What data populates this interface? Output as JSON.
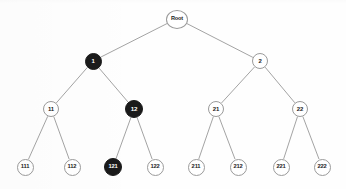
{
  "diagram": {
    "type": "binary-tree",
    "title": "",
    "canvas": {
      "width": 346,
      "height": 189
    },
    "style": {
      "background_color": "#fefefe",
      "edge_color": "#8c8c8c",
      "edge_width": 0.8,
      "light_node_fill": "#ffffff",
      "light_node_border": "#9a9a9a",
      "light_node_text": "#1c1c1c",
      "dark_node_fill": "#1a1a1a",
      "dark_node_text": "#ffffff"
    },
    "levels": [
      {
        "index": 0,
        "y": 19,
        "node_ids": [
          "root"
        ]
      },
      {
        "index": 1,
        "y": 61,
        "node_ids": [
          "n1",
          "n2"
        ]
      },
      {
        "index": 2,
        "y": 109,
        "node_ids": [
          "n11",
          "n12",
          "n21",
          "n22"
        ]
      },
      {
        "index": 3,
        "y": 167,
        "node_ids": [
          "n111",
          "n112",
          "n121",
          "n122",
          "n211",
          "n212",
          "n221",
          "n222"
        ]
      }
    ],
    "nodes": [
      {
        "id": "root",
        "label": "Root",
        "x": 177,
        "y": 19,
        "r": 10.5,
        "w": 22,
        "h": 19,
        "fill": "light",
        "font_size": 5.6,
        "level": 0,
        "parent": null
      },
      {
        "id": "n1",
        "label": "1",
        "x": 93,
        "y": 61,
        "r": 8.5,
        "w": 17,
        "h": 17,
        "fill": "dark",
        "font_size": 6.0,
        "level": 1,
        "parent": "root"
      },
      {
        "id": "n2",
        "label": "2",
        "x": 260,
        "y": 61,
        "r": 8.0,
        "w": 16,
        "h": 16,
        "fill": "light",
        "font_size": 6.0,
        "level": 1,
        "parent": "root"
      },
      {
        "id": "n11",
        "label": "11",
        "x": 51,
        "y": 109,
        "r": 8.0,
        "w": 16,
        "h": 16,
        "fill": "light",
        "font_size": 6.0,
        "level": 2,
        "parent": "n1"
      },
      {
        "id": "n12",
        "label": "12",
        "x": 134,
        "y": 109,
        "r": 9.0,
        "w": 18,
        "h": 18,
        "fill": "dark",
        "font_size": 6.2,
        "level": 2,
        "parent": "n1"
      },
      {
        "id": "n21",
        "label": "21",
        "x": 216,
        "y": 109,
        "r": 8.0,
        "w": 16,
        "h": 16,
        "fill": "light",
        "font_size": 6.0,
        "level": 2,
        "parent": "n2"
      },
      {
        "id": "n22",
        "label": "22",
        "x": 300,
        "y": 109,
        "r": 8.0,
        "w": 16,
        "h": 16,
        "fill": "light",
        "font_size": 6.0,
        "level": 2,
        "parent": "n2"
      },
      {
        "id": "n111",
        "label": "111",
        "x": 25,
        "y": 167,
        "r": 8.5,
        "w": 17,
        "h": 17,
        "fill": "light",
        "font_size": 5.8,
        "level": 3,
        "parent": "n11"
      },
      {
        "id": "n112",
        "label": "112",
        "x": 72,
        "y": 167,
        "r": 8.5,
        "w": 17,
        "h": 17,
        "fill": "light",
        "font_size": 5.8,
        "level": 3,
        "parent": "n11"
      },
      {
        "id": "n121",
        "label": "121",
        "x": 113,
        "y": 167,
        "r": 9.0,
        "w": 18,
        "h": 18,
        "fill": "dark",
        "font_size": 5.8,
        "level": 3,
        "parent": "n12"
      },
      {
        "id": "n122",
        "label": "122",
        "x": 155,
        "y": 167,
        "r": 8.5,
        "w": 17,
        "h": 17,
        "fill": "light",
        "font_size": 5.8,
        "level": 3,
        "parent": "n12"
      },
      {
        "id": "n211",
        "label": "211",
        "x": 196,
        "y": 167,
        "r": 8.5,
        "w": 17,
        "h": 17,
        "fill": "light",
        "font_size": 5.8,
        "level": 3,
        "parent": "n21"
      },
      {
        "id": "n212",
        "label": "212",
        "x": 238,
        "y": 167,
        "r": 8.5,
        "w": 17,
        "h": 17,
        "fill": "light",
        "font_size": 5.8,
        "level": 3,
        "parent": "n21"
      },
      {
        "id": "n221",
        "label": "221",
        "x": 281,
        "y": 167,
        "r": 8.5,
        "w": 17,
        "h": 17,
        "fill": "light",
        "font_size": 5.8,
        "level": 3,
        "parent": "n22"
      },
      {
        "id": "n222",
        "label": "222",
        "x": 322,
        "y": 167,
        "r": 8.5,
        "w": 17,
        "h": 17,
        "fill": "light",
        "font_size": 5.8,
        "level": 3,
        "parent": "n22"
      }
    ],
    "edges": [
      {
        "from": "root",
        "to": "n1"
      },
      {
        "from": "root",
        "to": "n2"
      },
      {
        "from": "n1",
        "to": "n11"
      },
      {
        "from": "n1",
        "to": "n12"
      },
      {
        "from": "n2",
        "to": "n21"
      },
      {
        "from": "n2",
        "to": "n22"
      },
      {
        "from": "n11",
        "to": "n111"
      },
      {
        "from": "n11",
        "to": "n112"
      },
      {
        "from": "n12",
        "to": "n121"
      },
      {
        "from": "n12",
        "to": "n122"
      },
      {
        "from": "n21",
        "to": "n211"
      },
      {
        "from": "n21",
        "to": "n212"
      },
      {
        "from": "n22",
        "to": "n221"
      },
      {
        "from": "n22",
        "to": "n222"
      }
    ],
    "highlighted_nodes": [
      "n1",
      "n12",
      "n121"
    ]
  }
}
